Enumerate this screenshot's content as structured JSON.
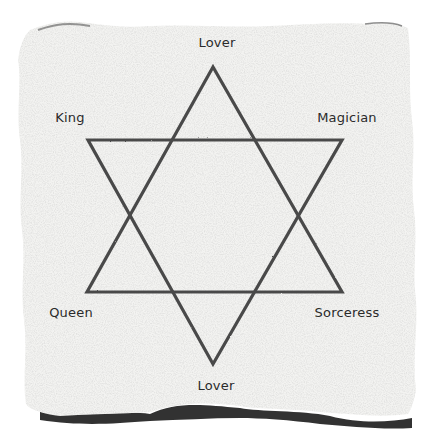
{
  "diagram": {
    "type": "hexagram",
    "colors": {
      "background": "#ffffff",
      "paper": "#f3f3f1",
      "paper_shadow": "#1c1c1c",
      "lines": "#4a4a4a",
      "text": "#2a2a2a"
    },
    "vertices": {
      "top": {
        "label": "Lover",
        "x": 213,
        "y": 67
      },
      "upper_left": {
        "label": "King",
        "x": 88,
        "y": 140
      },
      "upper_right": {
        "label": "Magician",
        "x": 342,
        "y": 140
      },
      "lower_left": {
        "label": "Queen",
        "x": 87,
        "y": 292
      },
      "lower_right": {
        "label": "Sorceress",
        "x": 342,
        "y": 292
      },
      "bottom": {
        "label": "Lover",
        "x": 213,
        "y": 364
      }
    },
    "triangles": [
      {
        "name": "upward",
        "points": "213,67 87,292 342,292"
      },
      {
        "name": "downward",
        "points": "88,140 342,140 213,364"
      }
    ]
  }
}
